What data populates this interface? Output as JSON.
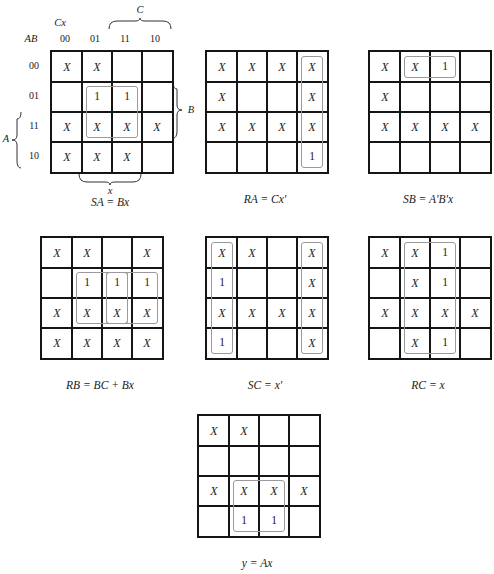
{
  "figure": {
    "symbols": {
      "x": "X",
      "one": "1",
      "empty": ""
    }
  },
  "header": {
    "top_var_label": "Cx",
    "side_var_label": "AB",
    "col_labels": [
      "00",
      "01",
      "11",
      "10"
    ],
    "row_labels": [
      "00",
      "01",
      "11",
      "10"
    ],
    "brace_c_label": "C",
    "brace_b_label": "B",
    "brace_a_label": "A",
    "brace_x_label": "x"
  },
  "maps": [
    {
      "id": "map-sa",
      "caption": "SA = Bx",
      "cells": [
        [
          "X",
          "X",
          "",
          ""
        ],
        [
          "",
          "1",
          "1",
          ""
        ],
        [
          "X",
          "X",
          "X",
          "X"
        ],
        [
          "X",
          "X",
          "X",
          ""
        ]
      ],
      "groups": [
        {
          "name": "group-bx",
          "row": 1,
          "col": 1,
          "rowspan": 2,
          "colspan": 2
        }
      ]
    },
    {
      "id": "map-ra",
      "caption": "RA = Cx'",
      "cells": [
        [
          "X",
          "X",
          "X",
          "X"
        ],
        [
          "X",
          "",
          "",
          "X"
        ],
        [
          "X",
          "X",
          "X",
          "X"
        ],
        [
          "",
          "",
          "",
          "1"
        ]
      ],
      "groups": [
        {
          "name": "group-cxprime",
          "row": 0,
          "col": 3,
          "rowspan": 4,
          "colspan": 1
        }
      ]
    },
    {
      "id": "map-sb",
      "caption": "SB = A'B'x",
      "cells": [
        [
          "X",
          "X",
          "1",
          ""
        ],
        [
          "X",
          "",
          "",
          ""
        ],
        [
          "X",
          "X",
          "X",
          "X"
        ],
        [
          "",
          "",
          "",
          ""
        ]
      ],
      "groups": [
        {
          "name": "group-apbpx",
          "row": 0,
          "col": 1,
          "rowspan": 1,
          "colspan": 2
        }
      ]
    },
    {
      "id": "map-rb",
      "caption": "RB = BC + Bx",
      "cells": [
        [
          "X",
          "X",
          "",
          "X"
        ],
        [
          "",
          "1",
          "1",
          "1"
        ],
        [
          "X",
          "X",
          "X",
          "X"
        ],
        [
          "X",
          "X",
          "X",
          "X"
        ]
      ],
      "groups": [
        {
          "name": "group-bx",
          "row": 1,
          "col": 1,
          "rowspan": 2,
          "colspan": 2
        },
        {
          "name": "group-bc",
          "row": 1,
          "col": 2,
          "rowspan": 2,
          "colspan": 2
        },
        {
          "name": "group-bc-inner",
          "row": 1,
          "col": 2,
          "rowspan": 2,
          "colspan": 1
        }
      ]
    },
    {
      "id": "map-sc",
      "caption": "SC = x'",
      "cells": [
        [
          "X",
          "X",
          "",
          "X"
        ],
        [
          "1",
          "",
          "",
          "X"
        ],
        [
          "X",
          "X",
          "X",
          "X"
        ],
        [
          "1",
          "",
          "",
          "X"
        ]
      ],
      "groups": [
        {
          "name": "group-xprime-left",
          "row": 0,
          "col": 0,
          "rowspan": 4,
          "colspan": 1
        },
        {
          "name": "group-xprime-right",
          "row": 0,
          "col": 3,
          "rowspan": 4,
          "colspan": 1
        }
      ]
    },
    {
      "id": "map-rc",
      "caption": "RC = x",
      "cells": [
        [
          "X",
          "X",
          "1",
          ""
        ],
        [
          "",
          "X",
          "1",
          ""
        ],
        [
          "X",
          "X",
          "X",
          "X"
        ],
        [
          "",
          "X",
          "1",
          ""
        ]
      ],
      "groups": [
        {
          "name": "group-x",
          "row": 0,
          "col": 1,
          "rowspan": 4,
          "colspan": 2
        }
      ]
    },
    {
      "id": "map-y",
      "caption": "y = Ax",
      "cells": [
        [
          "X",
          "X",
          "",
          ""
        ],
        [
          "",
          "",
          "",
          ""
        ],
        [
          "X",
          "X",
          "X",
          "X"
        ],
        [
          "",
          "1",
          "1",
          ""
        ]
      ],
      "groups": [
        {
          "name": "group-ax",
          "row": 2,
          "col": 1,
          "rowspan": 2,
          "colspan": 2
        }
      ]
    }
  ]
}
